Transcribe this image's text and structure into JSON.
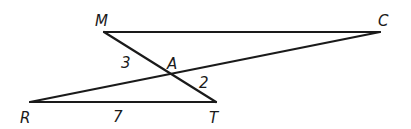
{
  "diagram": {
    "type": "geometry",
    "points": {
      "M": {
        "label": "M",
        "x": 104,
        "y": 32
      },
      "C": {
        "label": "C",
        "x": 380,
        "y": 32
      },
      "R": {
        "label": "R",
        "x": 30,
        "y": 102
      },
      "T": {
        "label": "T",
        "x": 216,
        "y": 102
      },
      "A": {
        "label": "A",
        "x": 173,
        "y": 75
      }
    },
    "segments": [
      {
        "from": "M",
        "to": "C"
      },
      {
        "from": "M",
        "to": "T"
      },
      {
        "from": "R",
        "to": "C"
      },
      {
        "from": "R",
        "to": "T"
      }
    ],
    "measures": {
      "MA": "3",
      "AT": "2",
      "RT": "7"
    }
  }
}
